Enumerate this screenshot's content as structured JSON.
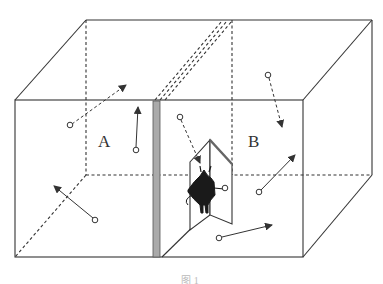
{
  "diagram": {
    "labels": {
      "chamber_a": "A",
      "chamber_b": "B"
    },
    "caption": "图 1",
    "colors": {
      "line": "#333333",
      "partition": "#aaaaaa",
      "demon": "#1a1a1a"
    },
    "molecules": [
      {
        "chamber": "A",
        "from": [
          70,
          125
        ],
        "to": [
          126,
          85
        ],
        "dashed": true
      },
      {
        "chamber": "A",
        "from": [
          136,
          150
        ],
        "to": [
          138,
          107
        ],
        "dashed": false
      },
      {
        "chamber": "A",
        "from": [
          95,
          220
        ],
        "to": [
          54,
          186
        ],
        "dashed": false
      },
      {
        "chamber": "B",
        "from": [
          180,
          117
        ],
        "to": [
          200,
          163
        ],
        "dashed": true
      },
      {
        "chamber": "B",
        "from": [
          268,
          75
        ],
        "to": [
          282,
          127
        ],
        "dashed": true
      },
      {
        "chamber": "B",
        "from": [
          259,
          192
        ],
        "to": [
          295,
          155
        ],
        "dashed": false
      },
      {
        "chamber": "B",
        "from": [
          219,
          238
        ],
        "to": [
          272,
          225
        ],
        "dashed": false
      },
      {
        "chamber": "B",
        "from": [
          225,
          188
        ],
        "to": [
          225,
          188
        ],
        "dashed": false
      }
    ]
  }
}
